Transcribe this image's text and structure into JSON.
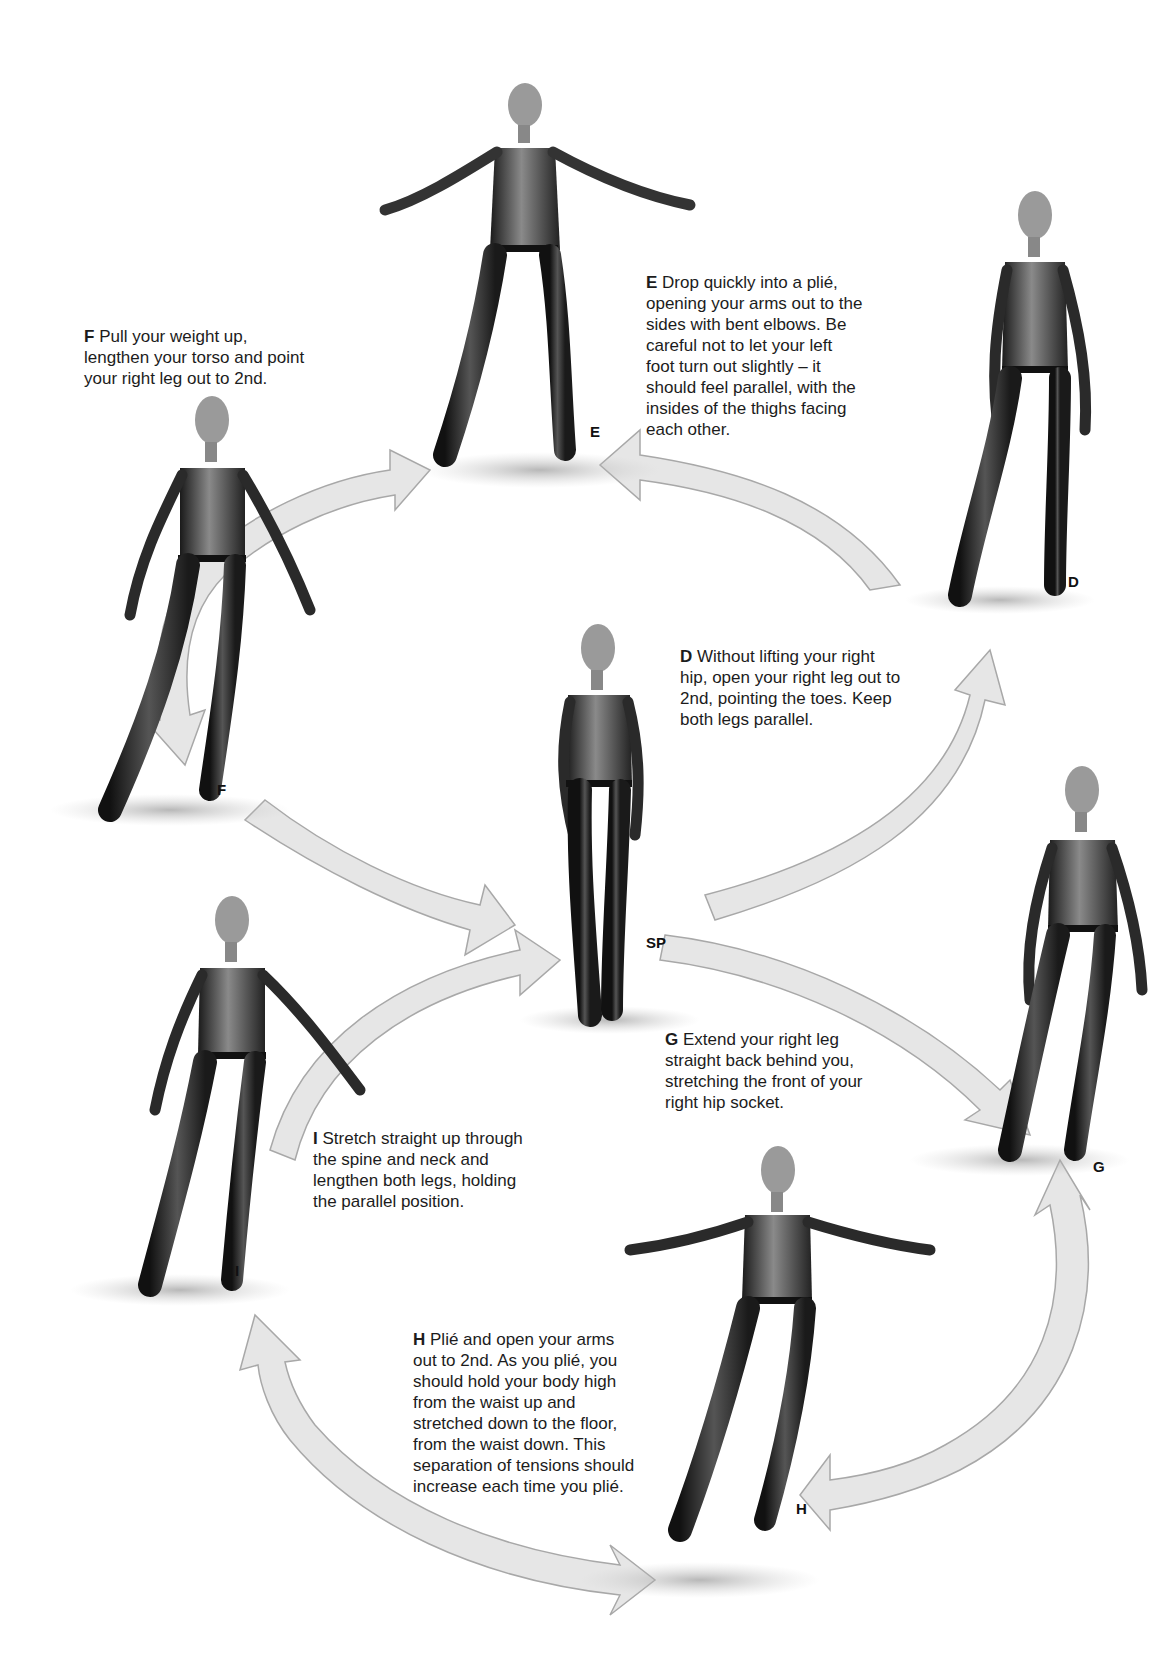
{
  "figures": {
    "SP": {
      "label": "SP"
    },
    "D": {
      "label": "D"
    },
    "E": {
      "label": "E"
    },
    "F": {
      "label": "F"
    },
    "G": {
      "label": "G"
    },
    "H": {
      "label": "H"
    },
    "I": {
      "label": "I"
    }
  },
  "captions": {
    "E": {
      "letter": "E",
      "lines": [
        "Drop quickly into a plié,",
        "opening your arms out to the",
        "sides with bent elbows. Be",
        "careful not to let your left",
        "foot turn out slightly – it",
        "should feel parallel, with the",
        "insides of the thighs facing",
        "each other."
      ]
    },
    "F": {
      "letter": "F",
      "lines": [
        "Pull your weight up,",
        "lengthen your torso and point",
        "your right leg out to 2nd."
      ]
    },
    "D": {
      "letter": "D",
      "lines": [
        "Without lifting your right",
        "hip, open your right leg out to",
        "2nd, pointing the toes. Keep",
        "both legs parallel."
      ]
    },
    "G": {
      "letter": "G",
      "lines": [
        "Extend your right leg",
        "straight back behind you,",
        "stretching the front of your",
        "right hip socket."
      ]
    },
    "I": {
      "letter": "I",
      "lines": [
        "Stretch straight up through",
        "the spine and neck and",
        "lengthen both legs, holding",
        "the parallel position."
      ]
    },
    "H": {
      "letter": "H",
      "lines": [
        "Plié and open your arms",
        "out to 2nd. As you plié, you",
        "should hold your body high",
        "from the waist up and",
        "stretched down to the floor,",
        "from the waist down. This",
        "separation of tensions should",
        "increase each time you plié."
      ]
    }
  },
  "colors": {
    "arrow_fill": "#e6e6e6",
    "arrow_stroke": "#a8a8a8",
    "leotard": "#2a2a2a",
    "skin": "#b8b8b8",
    "text": "#1c1c1c"
  }
}
